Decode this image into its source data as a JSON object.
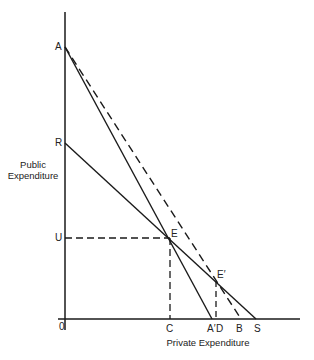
{
  "diagram": {
    "axes": {
      "y_label_line1": "Public",
      "y_label_line2": "Expenditure",
      "x_label": "Private Expenditure",
      "origin": "0"
    },
    "points": {
      "A": "A",
      "R": "R",
      "U": "U",
      "E": "E",
      "E_prime": "E′",
      "C": "C",
      "A_prime": "A′",
      "D": "D",
      "B": "B",
      "S": "S"
    },
    "lines": [
      {
        "name": "A to A'",
        "style": "solid"
      },
      {
        "name": "A to B",
        "style": "dashed"
      },
      {
        "name": "R to S",
        "style": "solid"
      },
      {
        "name": "U to E",
        "style": "dashed"
      },
      {
        "name": "E to C",
        "style": "dashed"
      },
      {
        "name": "E' to D",
        "style": "dashed"
      }
    ],
    "colors": {
      "ink": "#1a1a1a",
      "background": "#ffffff"
    }
  }
}
